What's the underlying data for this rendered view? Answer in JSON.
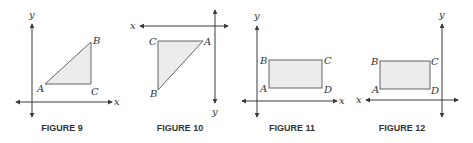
{
  "figures": [
    {
      "caption": "FIGURE 9",
      "axis_labels": {
        "x": "x",
        "y": "y"
      },
      "shape": "triangle",
      "vertices": {
        "A": "A",
        "B": "B",
        "C": "C"
      }
    },
    {
      "caption": "FIGURE 10",
      "axis_labels": {
        "x": "x",
        "y": "y"
      },
      "shape": "triangle",
      "vertices": {
        "A": "A",
        "B": "B",
        "C": "C"
      }
    },
    {
      "caption": "FIGURE 11",
      "axis_labels": {
        "x": "x",
        "y": "y"
      },
      "shape": "rectangle",
      "vertices": {
        "A": "A",
        "B": "B",
        "C": "C",
        "D": "D"
      }
    },
    {
      "caption": "FIGURE 12",
      "axis_labels": {
        "x": "x",
        "y": "y"
      },
      "shape": "rectangle",
      "vertices": {
        "A": "A",
        "B": "B",
        "C": "C",
        "D": "D"
      }
    }
  ],
  "colors": {
    "fill": "#ececec",
    "stroke": "#555555",
    "axis": "#3a3a3a",
    "text": "#333333"
  }
}
